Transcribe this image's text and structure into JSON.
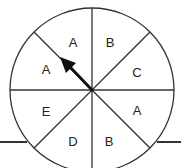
{
  "spinner": {
    "title": "Spinner",
    "sections": [
      {
        "index": 0,
        "label": "B"
      },
      {
        "index": 1,
        "label": "C"
      },
      {
        "index": 2,
        "label": "A"
      },
      {
        "index": 3,
        "label": "B"
      },
      {
        "index": 4,
        "label": "D"
      },
      {
        "index": 5,
        "label": "E"
      },
      {
        "index": 6,
        "label": "A"
      },
      {
        "index": 7,
        "label": "A"
      }
    ],
    "section_count": 8,
    "arrow_points_to_section": "boundary between A (upper-left) and A (top-left)",
    "arrow_direction_degrees_from_north_clockwise": 315,
    "colors": {
      "line": "#333333",
      "arrow": "#111111",
      "background": "#ffffff",
      "text": "#222222"
    }
  }
}
